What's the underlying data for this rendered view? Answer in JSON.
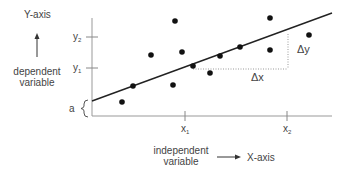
{
  "diagram": {
    "type": "linear-regression-scatter",
    "y_axis": {
      "label": "Y-axis",
      "description_line1": "dependent",
      "description_line2": "variable",
      "ticks": [
        {
          "label": "y",
          "sub": "2",
          "y": 37
        },
        {
          "label": "y",
          "sub": "1",
          "y": 68
        }
      ],
      "intercept_label": "a"
    },
    "x_axis": {
      "label": "X-axis",
      "description_line1": "independent",
      "description_line2": "variable",
      "ticks": [
        {
          "label": "x",
          "sub": "1",
          "x": 185
        },
        {
          "label": "x",
          "sub": "2",
          "x": 287
        }
      ]
    },
    "delta_x_label": "Δx",
    "delta_y_label": "Δy",
    "regression_line": {
      "x1": 92,
      "y1": 101,
      "x2": 332,
      "y2": 13
    },
    "points": [
      {
        "x": 122,
        "y": 102
      },
      {
        "x": 133,
        "y": 86
      },
      {
        "x": 151,
        "y": 55
      },
      {
        "x": 173,
        "y": 85
      },
      {
        "x": 175,
        "y": 21
      },
      {
        "x": 182,
        "y": 52
      },
      {
        "x": 193,
        "y": 66
      },
      {
        "x": 210,
        "y": 73
      },
      {
        "x": 220,
        "y": 56
      },
      {
        "x": 240,
        "y": 47
      },
      {
        "x": 270,
        "y": 18
      },
      {
        "x": 270,
        "y": 50
      },
      {
        "x": 309,
        "y": 35
      }
    ]
  }
}
